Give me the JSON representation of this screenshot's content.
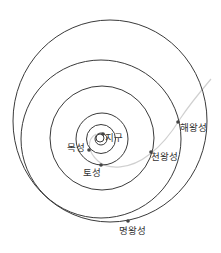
{
  "diagram": {
    "title": "",
    "colors": {
      "orbit": "#3a3a3a",
      "trajectory": "#d0d0d0",
      "planet": "#444444",
      "text": "#333333",
      "background": "#ffffff"
    },
    "sun": {
      "cx": 100,
      "cy": 138,
      "r": 4
    },
    "orbits": [
      {
        "name": "earth-orbit",
        "cx": 101,
        "cy": 139,
        "rx": 6,
        "ry": 6
      },
      {
        "name": "jupiter-orbit",
        "cx": 101,
        "cy": 139,
        "rx": 14.5,
        "ry": 14.5
      },
      {
        "name": "saturn-orbit",
        "cx": 102,
        "cy": 139,
        "rx": 26,
        "ry": 26
      },
      {
        "name": "uranus-orbit",
        "cx": 102,
        "cy": 138,
        "rx": 52,
        "ry": 52
      },
      {
        "name": "neptune-orbit",
        "cx": 101,
        "cy": 139,
        "rx": 80,
        "ry": 79
      },
      {
        "name": "pluto-orbit",
        "cx": 110,
        "cy": 121,
        "rx": 97,
        "ry": 101
      }
    ],
    "planets": [
      {
        "name": "earth",
        "label": "지구",
        "x": 103,
        "y": 134,
        "label_x": 105,
        "label_y": 133
      },
      {
        "name": "jupiter",
        "label": "목성",
        "x": 89,
        "y": 150,
        "label_x": 67,
        "label_y": 143
      },
      {
        "name": "saturn",
        "label": "토성",
        "x": 101,
        "y": 165,
        "label_x": 83,
        "label_y": 168
      },
      {
        "name": "uranus",
        "label": "천왕성",
        "x": 151,
        "y": 152,
        "label_x": 151,
        "label_y": 152
      },
      {
        "name": "neptune",
        "label": "해왕성",
        "x": 178,
        "y": 122,
        "label_x": 180,
        "label_y": 123
      },
      {
        "name": "pluto",
        "label": "명왕성",
        "x": 128,
        "y": 221,
        "label_x": 119,
        "label_y": 226
      }
    ],
    "trajectory_path": "M 96 134 C 86 140, 88 152, 98 161 C 108 170, 130 170, 150 154 C 162 145, 172 132, 180 119 C 190 104, 200 92, 211 79"
  }
}
